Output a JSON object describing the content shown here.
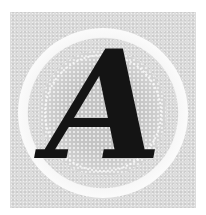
{
  "initial": {
    "letter": "A",
    "letter_color": "#141414",
    "background_icon": "seal-emblem-icon"
  },
  "colors": {
    "panel": "#dcdcdc",
    "ring": "#ffffff",
    "seal": "#cfcfcf"
  }
}
